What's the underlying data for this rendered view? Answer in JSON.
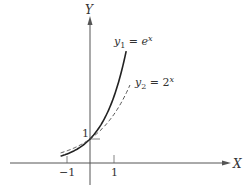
{
  "chart_data": {
    "type": "line",
    "title": "",
    "xlabel": "X",
    "ylabel": "Y",
    "xlim": [
      -3.3,
      5.8
    ],
    "ylim": [
      -0.9,
      6.2
    ],
    "grid": false,
    "legend_position": "inline-labels",
    "x_ticks": [
      {
        "value": -1,
        "label": "−1"
      },
      {
        "value": 1,
        "label": "1"
      }
    ],
    "y_ticks": [
      {
        "value": 1,
        "label": "1"
      }
    ],
    "series": [
      {
        "name": "y1 = e^x",
        "label_main": "y",
        "label_sub": "1",
        "label_eq": " = e",
        "label_sup": "x",
        "function": "exp",
        "style": "solid",
        "x_range": [
          -1.25,
          1.54
        ],
        "x": [
          -1.25,
          -1,
          -0.5,
          0,
          0.5,
          1,
          1.25,
          1.54
        ],
        "values": [
          0.29,
          0.37,
          0.61,
          1.0,
          1.65,
          2.72,
          3.49,
          4.66
        ]
      },
      {
        "name": "y2 = 2^x",
        "label_main": "y",
        "label_sub": "2",
        "label_eq": " = 2",
        "label_sup": "x",
        "function": "pow2",
        "style": "dashed",
        "x_range": [
          -1.25,
          1.7
        ],
        "x": [
          -1.25,
          -1,
          -0.5,
          0,
          0.5,
          1,
          1.5,
          1.7
        ],
        "values": [
          0.42,
          0.5,
          0.71,
          1.0,
          1.41,
          2.0,
          2.83,
          3.25
        ]
      }
    ],
    "annotations": [
      {
        "text": "1",
        "at": [
          0,
          1
        ],
        "note": "intersection point label on Y axis"
      }
    ]
  },
  "axes": {
    "x_label": "X",
    "y_label": "Y"
  }
}
